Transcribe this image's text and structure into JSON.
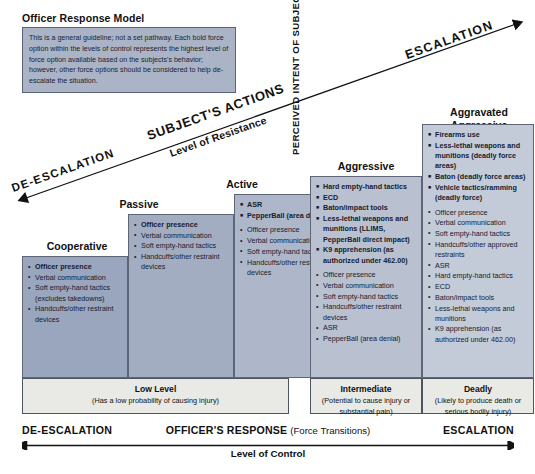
{
  "title": "Officer Response Model",
  "note": "This is a general guideline; not a set pathway. Each bold force option within the levels of control represents the highest level of force option available based on the subjects's behavior; however, other force options should be considered to help de-escalate the situation.",
  "diagonal_axis": {
    "escalation": "ESCALATION",
    "de_escalation": "DE-ESCALATION",
    "name": "SUBJECT'S ACTIONS",
    "sublabel": "Level of Resistance"
  },
  "vertical_axis": {
    "label": "PERCEIVED INTENT OF SUBJECT TO HARM"
  },
  "bottom_axis": {
    "de_escalation": "DE-ESCALATION",
    "name": "OFFICER'S RESPONSE",
    "name_suffix": "(Force Transitions)",
    "escalation": "ESCALATION",
    "sublabel": "Level of Control"
  },
  "columns": [
    {
      "heading": "Cooperative",
      "color": "#9aa6bd",
      "bold_options": [],
      "options": [
        "Officer presence",
        "Verbal communication",
        "Soft empty-hand tactics (excludes takedowns)",
        "Handcuffs/other restraint devices"
      ],
      "first_bold": true
    },
    {
      "heading": "Passive",
      "color": "#a3adc2",
      "bold_options": [],
      "options": [
        "Officer presence",
        "Verbal communication",
        "Soft empty-hand tactics",
        "Handcuffs/other restraint devices"
      ],
      "first_bold": true
    },
    {
      "heading": "Active",
      "color": "#aeb7c9",
      "bold_options": [
        "ASR",
        "PepperBall (area denial)"
      ],
      "options": [
        "Officer presence",
        "Verbal communication",
        "Soft empty-hand tactics",
        "Handcuffs/other restraint devices"
      ],
      "first_bold": false
    },
    {
      "heading": "Aggressive",
      "color": "#b9c1d0",
      "bold_options": [
        "Hard empty-hand tactics",
        "ECD",
        "Baton/impact tools",
        "Less-lethal weapons and munitions (LLIMS, PepperBall direct impact)",
        "K9 apprehension (as authorized under 462.00)"
      ],
      "options": [
        "Officer presence",
        "Verbal communication",
        "Soft empty-hand tactics",
        "Handcuffs/other restraint devices",
        "ASR",
        "PepperBall (area denial)"
      ],
      "first_bold": false
    },
    {
      "heading": "Aggravated Aggressive",
      "heading_line1": "Aggravated",
      "heading_line2": "Aggressive",
      "color": "#c4cbd8",
      "bold_options": [
        "Firearms use",
        "Less-lethal weapons and munitions (deadly force areas)",
        "Baton (deadly force areas)",
        "Vehicle tactics/ramming (deadly force)"
      ],
      "options": [
        "Officer presence",
        "Verbal communication",
        "Soft empty-hand tactics",
        "Handcuffs/other approved restraints",
        "ASR",
        "Hard empty-hand tactics",
        "ECD",
        "Baton/impact tools",
        "Less-lethal weapons and munitions",
        "K9 apprehension (as authorized under 462.00)"
      ],
      "first_bold": false
    }
  ],
  "levels": [
    {
      "name": "Low Level",
      "description": "(Has a low probability of causing injury)"
    },
    {
      "name": "Intermediate",
      "description": "(Potential to cause injury or substantial pain)"
    },
    {
      "name": "Deadly",
      "description": "(Likely to produce death or serious bodily injury)"
    }
  ]
}
